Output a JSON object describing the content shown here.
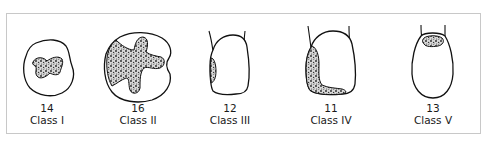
{
  "figure": {
    "teeth": [
      {
        "number": "14",
        "class_label": "Class I",
        "view": "occlusal",
        "cavity_site": "occlusal pits and fissures"
      },
      {
        "number": "16",
        "class_label": "Class II",
        "view": "occlusal",
        "cavity_site": "occlusal with proximal extension"
      },
      {
        "number": "12",
        "class_label": "Class III",
        "view": "labial",
        "cavity_site": "proximal surface"
      },
      {
        "number": "11",
        "class_label": "Class IV",
        "view": "labial",
        "cavity_site": "proximal surface including incisal angle"
      },
      {
        "number": "13",
        "class_label": "Class V",
        "view": "labial",
        "cavity_site": "cervical third"
      }
    ]
  },
  "colors": {
    "line": "#111111",
    "frame": "#c8c8c8",
    "stipple_fill": "#d6d6d6",
    "background": "#ffffff"
  }
}
